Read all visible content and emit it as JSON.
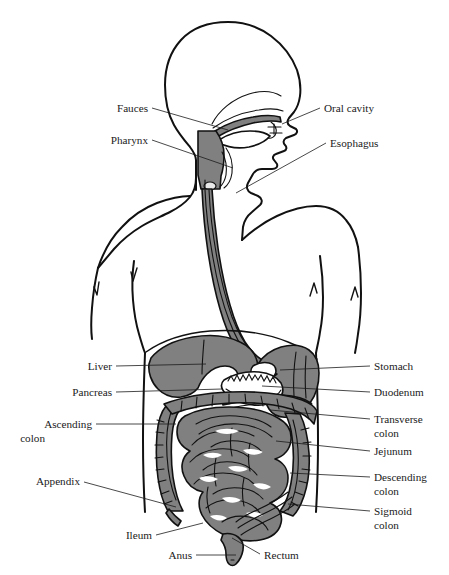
{
  "figure": {
    "width": 449,
    "height": 575,
    "background_color": "#ffffff",
    "organ_fill_color": "#808080",
    "outline_color": "#111111",
    "label_color": "#1a1a1a"
  },
  "labels_left": [
    {
      "id": "fauces",
      "text": "Fauces",
      "text2": "",
      "x": 148,
      "y": 112,
      "lead": "M152,108 L228,130"
    },
    {
      "id": "pharynx",
      "text": "Pharynx",
      "text2": "",
      "x": 148,
      "y": 144,
      "lead": "M152,140 L233,168"
    },
    {
      "id": "liver",
      "text": "Liver",
      "text2": "",
      "x": 112,
      "y": 370,
      "lead": "M116,366 L206,364"
    },
    {
      "id": "pancreas",
      "text": "Pancreas",
      "text2": "",
      "x": 112,
      "y": 396,
      "lead": "M116,392 L222,389"
    },
    {
      "id": "ascending-colon",
      "text": "Ascending",
      "text2": "colon",
      "x": 92,
      "y": 428,
      "lead": "M96,424 L176,424"
    },
    {
      "id": "appendix",
      "text": "Appendix",
      "text2": "",
      "x": 80,
      "y": 485,
      "lead": "M84,482 L176,507"
    },
    {
      "id": "ileum",
      "text": "Ileum",
      "text2": "",
      "x": 152,
      "y": 539,
      "lead": "M156,535 L203,523"
    },
    {
      "id": "anus",
      "text": "Anus",
      "text2": "",
      "x": 192,
      "y": 559,
      "lead": "M196,555 L236,555"
    }
  ],
  "labels_right": [
    {
      "id": "oral-cavity",
      "text": "Oral cavity",
      "text2": "",
      "x": 324,
      "y": 112,
      "lead": "M320,108 L282,124"
    },
    {
      "id": "esophagus",
      "text": "Esophagus",
      "text2": "",
      "x": 330,
      "y": 147,
      "lead": "M326,143 L236,193"
    },
    {
      "id": "stomach",
      "text": "Stomach",
      "text2": "",
      "x": 374,
      "y": 370,
      "lead": "M370,366 L280,370"
    },
    {
      "id": "duodenum",
      "text": "Duodenum",
      "text2": "",
      "x": 374,
      "y": 396,
      "lead": "M370,392 L262,386"
    },
    {
      "id": "transverse-colon",
      "text": "Transverse",
      "text2": "colon",
      "x": 374,
      "y": 423,
      "lead": "M370,419 L270,410"
    },
    {
      "id": "jejunum",
      "text": "Jejunum",
      "text2": "",
      "x": 374,
      "y": 455,
      "lead": "M370,451 L276,441"
    },
    {
      "id": "descending-colon",
      "text": "Descending",
      "text2": "colon",
      "x": 374,
      "y": 481,
      "lead": "M370,477 L290,473"
    },
    {
      "id": "sigmoid-colon",
      "text": "Sigmoid",
      "text2": "colon",
      "x": 374,
      "y": 515,
      "lead": "M370,511 L288,504"
    },
    {
      "id": "rectum",
      "text": "Rectum",
      "text2": "",
      "x": 264,
      "y": 559,
      "lead": "M260,554 L232,538"
    }
  ]
}
